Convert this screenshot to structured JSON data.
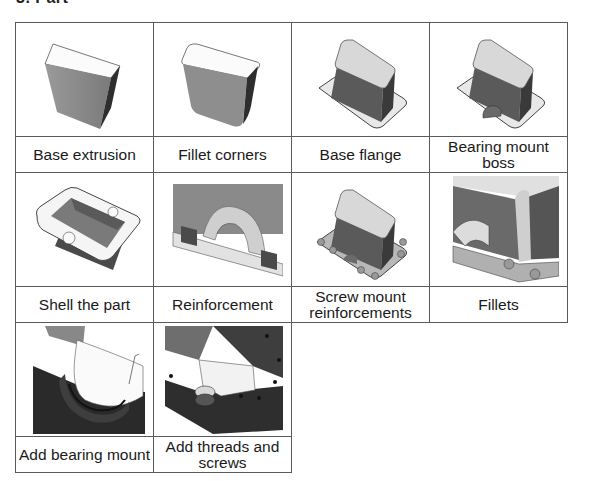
{
  "heading": "3. Part",
  "steps": [
    {
      "label": "Base extrusion",
      "image": "base-extrusion-render"
    },
    {
      "label": "Fillet corners",
      "image": "fillet-corners-render"
    },
    {
      "label": "Base flange",
      "image": "base-flange-render"
    },
    {
      "label": "Bearing mount boss",
      "image": "bearing-mount-boss-render"
    },
    {
      "label": "Shell the part",
      "image": "shell-part-render"
    },
    {
      "label": "Reinforcement",
      "image": "reinforcement-render"
    },
    {
      "label": "Screw mount reinforcements",
      "image": "screw-mount-reinforcements-render"
    },
    {
      "label": "Fillets",
      "image": "fillets-render"
    },
    {
      "label": "Add bearing mount",
      "image": "add-bearing-mount-render"
    },
    {
      "label": "Add threads and screws",
      "image": "add-threads-screws-render"
    }
  ],
  "colors": {
    "border": "#5a5a5a",
    "shade_dark": "#3a3a3a",
    "shade_mid": "#8a8a8a",
    "shade_light": "#f2f2f2"
  }
}
